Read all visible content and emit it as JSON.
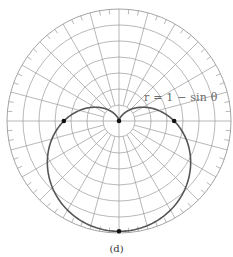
{
  "chart_data": {
    "type": "line",
    "subtype": "polar",
    "title": "",
    "caption": "(d)",
    "equation_label": "r = 1 − sin θ",
    "function": "r = 1 - sin(theta)",
    "r_max": 2,
    "grid": {
      "on": true,
      "concentric_circles": 7,
      "radial_line_step_deg": 15,
      "outer_tick_step_deg": 5
    },
    "marked_points": [
      {
        "theta_deg": 0,
        "r": 1,
        "label": ""
      },
      {
        "theta_deg": 180,
        "r": 1,
        "label": ""
      },
      {
        "theta_deg": 270,
        "r": 2,
        "label": ""
      },
      {
        "theta_deg": 90,
        "r": 0,
        "label": ""
      }
    ],
    "sample_points": [
      {
        "theta_deg": 0,
        "r": 1
      },
      {
        "theta_deg": 30,
        "r": 0.5
      },
      {
        "theta_deg": 60,
        "r": 0.134
      },
      {
        "theta_deg": 90,
        "r": 0
      },
      {
        "theta_deg": 120,
        "r": 0.134
      },
      {
        "theta_deg": 150,
        "r": 0.5
      },
      {
        "theta_deg": 180,
        "r": 1
      },
      {
        "theta_deg": 210,
        "r": 1.5
      },
      {
        "theta_deg": 240,
        "r": 1.866
      },
      {
        "theta_deg": 270,
        "r": 2
      },
      {
        "theta_deg": 300,
        "r": 1.866
      },
      {
        "theta_deg": 330,
        "r": 1.5
      },
      {
        "theta_deg": 360,
        "r": 1
      }
    ],
    "colors": {
      "grid": "#9a9a9a",
      "curve": "#555555",
      "points": "#111111",
      "label": "#6a6a6a"
    }
  },
  "figure": {
    "caption": "(d)",
    "equation_label": "r = 1 − sin θ"
  }
}
